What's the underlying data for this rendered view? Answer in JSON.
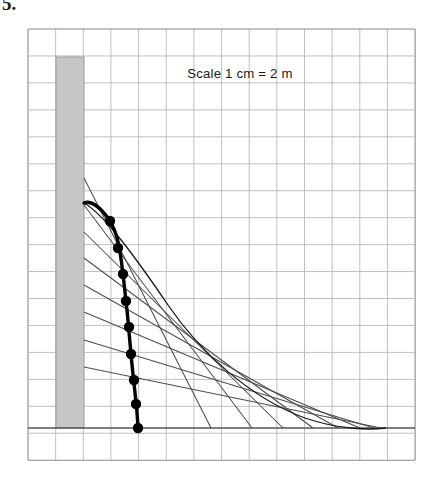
{
  "figure": {
    "number_label": "5.",
    "annotation": "Scale 1 cm = 2 m",
    "annotation_x": 240,
    "annotation_y": 78
  },
  "colors": {
    "background": "#ffffff",
    "grid_line": "#b9b9b9",
    "grid_border": "#8a8a8a",
    "ground_line": "#555555",
    "wall_fill": "#c6c6c6",
    "wall_stroke": "#9a9a9a",
    "ray_line": "#4d4d4d",
    "envelope_curve": "#1a1a1a",
    "locus_curve": "#000000",
    "point_marker": "#000000",
    "text": "#1a1a1a"
  },
  "grid": {
    "x0": 28,
    "y0": 29,
    "cols": 14,
    "rows": 16,
    "cell_w": 27.65,
    "cell_h": 26.95,
    "stroke_width": 0.9
  },
  "wall": {
    "label": "wall",
    "x": 56,
    "y": 57,
    "width": 28,
    "height": 371
  },
  "ground": {
    "label": "ground-line",
    "y": 428,
    "x1": 28,
    "x2": 415,
    "stroke_width": 1.6
  },
  "chart_data": {
    "type": "scatter",
    "title": "",
    "subtitle": "",
    "xlabel": "",
    "ylabel": "",
    "annotations": [
      "Scale 1 cm = 2 m"
    ],
    "grid": true,
    "legend": "none",
    "xlim": [
      28,
      415
    ],
    "ylim": [
      460,
      29
    ],
    "series": [
      {
        "name": "projectile-rays",
        "type": "line",
        "comment": "straight trajectory rays launched from the wall edge",
        "lines": [
          {
            "x1": 84,
            "y1": 178,
            "x2": 211,
            "y2": 428
          },
          {
            "x1": 84,
            "y1": 205,
            "x2": 252,
            "y2": 428
          },
          {
            "x1": 84,
            "y1": 232,
            "x2": 283,
            "y2": 428
          },
          {
            "x1": 84,
            "y1": 258,
            "x2": 313,
            "y2": 428
          },
          {
            "x1": 84,
            "y1": 285,
            "x2": 338,
            "y2": 428
          },
          {
            "x1": 84,
            "y1": 312,
            "x2": 360,
            "y2": 428
          },
          {
            "x1": 84,
            "y1": 340,
            "x2": 374,
            "y2": 428
          },
          {
            "x1": 84,
            "y1": 367,
            "x2": 381,
            "y2": 428
          }
        ]
      },
      {
        "name": "envelope-curve",
        "type": "curve",
        "comment": "outer envelope of all rays",
        "path": "M 84,203 C 104,214 136,258 168,305 C 200,352 250,398 305,418 C 340,430 370,430 386,428"
      },
      {
        "name": "locus-points",
        "type": "scatter",
        "comment": "marked points on the bold locus curve",
        "points": [
          {
            "x": 110,
            "y": 221
          },
          {
            "x": 118,
            "y": 248
          },
          {
            "x": 123,
            "y": 274
          },
          {
            "x": 126,
            "y": 301
          },
          {
            "x": 129,
            "y": 327
          },
          {
            "x": 131,
            "y": 354
          },
          {
            "x": 134,
            "y": 380
          },
          {
            "x": 136,
            "y": 404
          },
          {
            "x": 138,
            "y": 428
          }
        ],
        "marker_radius": 5.2
      },
      {
        "name": "locus-curve",
        "type": "curve",
        "comment": "bold curve through the marked points starting at the wall",
        "path": "M 84,203 C 90,200 100,206 110,221 C 116,231 119,240 123,274 C 126,299 128,316 131,354 C 134,388 137,404 138,428",
        "stroke_width": 3.4
      }
    ]
  }
}
